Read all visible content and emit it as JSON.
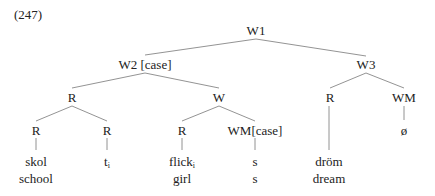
{
  "example_number": "(247)",
  "tree": {
    "nodes": {
      "w1": "W1",
      "w2": "W2 [case]",
      "w3": "W3",
      "r_a": "R",
      "w_a": "W",
      "r_b": "R",
      "wm_b": "WM",
      "r_1": "R",
      "r_2": "R",
      "r_3": "R",
      "wm_case": "WM[case]"
    },
    "leaves": {
      "skol": "skol",
      "school": "school",
      "trace": "t",
      "trace_index": "i",
      "flick": "flick",
      "flick_index": "i",
      "girl": "girl",
      "s1": "s",
      "s2": "s",
      "drom": "dröm",
      "dream": "dream",
      "null": "ø"
    }
  }
}
